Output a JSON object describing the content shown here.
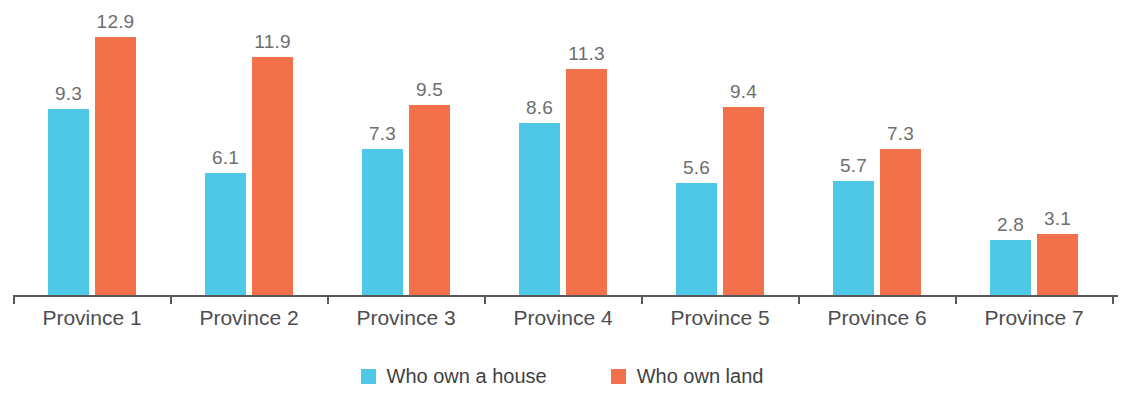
{
  "chart_data": {
    "type": "bar",
    "title": "",
    "subtitle": "",
    "xlabel": "",
    "ylabel": "",
    "ylim": [
      0,
      14.5
    ],
    "grid": false,
    "legend_position": "bottom-center",
    "categories": [
      "Province 1",
      "Province 2",
      "Province 3",
      "Province 4",
      "Province 5",
      "Province 6",
      "Province 7"
    ],
    "series": [
      {
        "name": "Who own a house",
        "color": "#4FC8E8",
        "values": [
          9.3,
          6.1,
          7.3,
          8.6,
          5.6,
          5.7,
          2.8
        ],
        "labels": [
          "9.3",
          "6.1",
          "7.3",
          "8.6",
          "5.6",
          "5.7",
          "2.8"
        ]
      },
      {
        "name": "Who own land",
        "color": "#F2714A",
        "values": [
          12.9,
          11.9,
          9.5,
          11.3,
          9.4,
          7.3,
          3.1
        ],
        "labels": [
          "12.9",
          "11.9",
          "9.5",
          "11.3",
          "9.4",
          "7.3",
          "3.1"
        ]
      }
    ]
  },
  "colors": {
    "series_house": "#4FC8E8",
    "series_land": "#F2714A",
    "value_label": "#6D6E70",
    "category_label": "#4D4D50",
    "axis": "#58585B",
    "background": "#FFFFFF"
  }
}
